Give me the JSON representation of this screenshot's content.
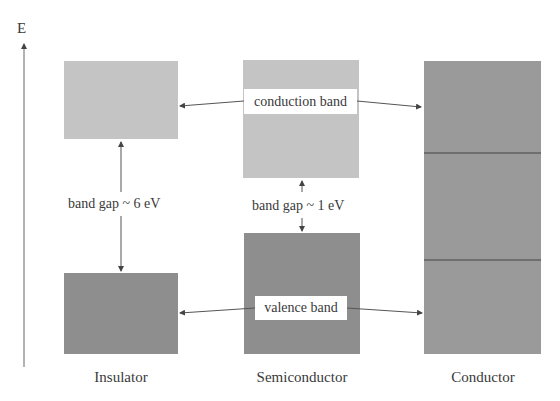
{
  "axis": {
    "label": "E",
    "direction": "up"
  },
  "materials": [
    {
      "name": "Insulator"
    },
    {
      "name": "Semiconductor"
    },
    {
      "name": "Conductor"
    }
  ],
  "bands": {
    "conduction_label": "conduction band",
    "valence_label": "valence band"
  },
  "gaps": {
    "insulator": "band gap ~ 6 eV",
    "semiconductor": "band gap ~ 1 eV"
  },
  "colors": {
    "conduction_fill": "#c4c4c4",
    "valence_fill": "#8e8e8e",
    "conductor_fill": "#9a9a9a",
    "line": "#555555"
  }
}
